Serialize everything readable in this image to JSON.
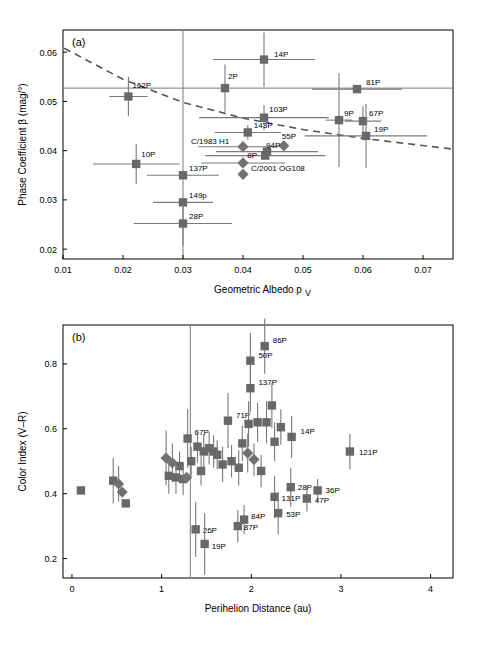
{
  "figure": {
    "width": 482,
    "height": 651,
    "marker_color": "#686868",
    "diamond_color": "#717171",
    "trend_color": "#555555",
    "error_color": "#7a7a7a"
  },
  "chart_data": [
    {
      "type": "scatter",
      "panel": "(a)",
      "title": "",
      "xlabel": "Geometric Albedo p_V",
      "ylabel": "Phase Coefficient β (mag/°)",
      "xlim": [
        0.01,
        0.075
      ],
      "ylim": [
        0.018,
        0.0645
      ],
      "xticks": [
        0.01,
        0.02,
        0.03,
        0.04,
        0.05,
        0.06,
        0.07
      ],
      "xticklabels": [
        "0.01",
        "0.02",
        "0.03",
        "0.04",
        "0.05",
        "0.06",
        "0.07"
      ],
      "yticks": [
        0.02,
        0.03,
        0.04,
        0.05,
        0.06
      ],
      "yticklabels": [
        "0.02",
        "0.03",
        "0.04",
        "0.05",
        "0.06"
      ],
      "grid": false,
      "legend": "none",
      "reference_lines": [
        {
          "orientation": "horizontal",
          "value": 0.0527
        },
        {
          "orientation": "vertical",
          "value": 0.03
        }
      ],
      "trend": {
        "style": "dashed",
        "points": [
          {
            "x": 0.0102,
            "y": 0.0608
          },
          {
            "x": 0.02,
            "y": 0.0545
          },
          {
            "x": 0.03,
            "y": 0.0498
          },
          {
            "x": 0.04,
            "y": 0.0466
          },
          {
            "x": 0.05,
            "y": 0.0443
          },
          {
            "x": 0.06,
            "y": 0.0425
          },
          {
            "x": 0.075,
            "y": 0.0403
          }
        ]
      },
      "points": [
        {
          "label": "14P",
          "marker": "square",
          "x": 0.0435,
          "y": 0.0585,
          "xerr": 0.0085,
          "yerr": 0.0055,
          "lx": 10,
          "ly": -3
        },
        {
          "label": "2P",
          "marker": "square",
          "x": 0.037,
          "y": 0.0527,
          "xerr": 0.0,
          "yerr": 0.0048,
          "lx": 3,
          "ly": -9
        },
        {
          "label": "81P",
          "marker": "square",
          "x": 0.059,
          "y": 0.0525,
          "xerr": 0.0075,
          "yerr": 0.0,
          "lx": 9,
          "ly": -4
        },
        {
          "label": "162P",
          "marker": "square",
          "x": 0.0209,
          "y": 0.051,
          "xerr": 0.0032,
          "yerr": 0.004,
          "lx": 4,
          "ly": -8
        },
        {
          "label": "103P",
          "marker": "square",
          "x": 0.0435,
          "y": 0.0467,
          "xerr": 0.0108,
          "yerr": 0.0025,
          "lx": 5,
          "ly": -6
        },
        {
          "label": "9P",
          "marker": "square",
          "x": 0.056,
          "y": 0.0462,
          "xerr": 0.0022,
          "yerr": 0.0095,
          "lx": 5,
          "ly": -4
        },
        {
          "label": "67P",
          "marker": "square",
          "x": 0.06,
          "y": 0.046,
          "xerr": 0.003,
          "yerr": 0.003,
          "lx": 6,
          "ly": -5
        },
        {
          "label": "143P",
          "marker": "square",
          "x": 0.0408,
          "y": 0.0437,
          "xerr": 0.0055,
          "yerr": 0.0015,
          "lx": 6,
          "ly": -4
        },
        {
          "label": "19P",
          "marker": "square",
          "x": 0.0605,
          "y": 0.043,
          "xerr": 0.0102,
          "yerr": 0.0065,
          "lx": 8,
          "ly": -4
        },
        {
          "label": "55P",
          "marker": "diamond",
          "x": 0.0468,
          "y": 0.041,
          "xerr": 0.0,
          "yerr": 0.0,
          "lx": -2,
          "ly": -7
        },
        {
          "label": "C/1983 H1",
          "marker": "diamond",
          "x": 0.04,
          "y": 0.0408,
          "xerr": 0.0075,
          "yerr": 0.0,
          "lx": -52,
          "ly": -3
        },
        {
          "label": "94P",
          "marker": "square",
          "x": 0.044,
          "y": 0.0398,
          "xerr": 0.0085,
          "yerr": 0.0,
          "lx": -1,
          "ly": -4
        },
        {
          "label": "8P",
          "marker": "square",
          "x": 0.0437,
          "y": 0.039,
          "xerr": 0.01,
          "yerr": 0.0,
          "lx": -18,
          "ly": 2
        },
        {
          "label": "10P",
          "marker": "square",
          "x": 0.0222,
          "y": 0.0373,
          "xerr": 0.0072,
          "yerr": 0.004,
          "lx": 5,
          "ly": -7
        },
        {
          "label": "C/2001 OG108",
          "marker": "diamond",
          "x": 0.04,
          "y": 0.0375,
          "xerr": 0.007,
          "yerr": 0.0,
          "lx": 8,
          "ly": 8
        },
        {
          "label": "137P",
          "marker": "square",
          "x": 0.03,
          "y": 0.035,
          "xerr": 0.006,
          "yerr": 0.0,
          "lx": 6,
          "ly": -4
        },
        {
          "label": "",
          "marker": "diamond",
          "x": 0.04,
          "y": 0.0352,
          "xerr": 0.0,
          "yerr": 0.0,
          "lx": 0,
          "ly": 0
        },
        {
          "label": "149p",
          "marker": "square",
          "x": 0.03,
          "y": 0.0295,
          "xerr": 0.005,
          "yerr": 0.0,
          "lx": 6,
          "ly": -4
        },
        {
          "label": "28P",
          "marker": "square",
          "x": 0.03,
          "y": 0.0252,
          "xerr": 0.0082,
          "yerr": 0.0045,
          "lx": 6,
          "ly": -5
        }
      ]
    },
    {
      "type": "scatter",
      "panel": "(b)",
      "title": "",
      "xlabel": "Perihelion Distance (au)",
      "ylabel": "Color Index (V–R)",
      "xlim": [
        -0.1,
        4.25
      ],
      "ylim": [
        0.14,
        0.92
      ],
      "xticks": [
        0,
        1,
        2,
        3,
        4
      ],
      "xticklabels": [
        "0",
        "1",
        "2",
        "3",
        "4"
      ],
      "yticks": [
        0.2,
        0.4,
        0.6,
        0.8
      ],
      "yticklabels": [
        "0.2",
        "0.4",
        "0.6",
        "0.8"
      ],
      "grid": false,
      "legend": "none",
      "reference_lines": [
        {
          "orientation": "vertical",
          "value": 1.32
        }
      ],
      "points": [
        {
          "label": "86P",
          "marker": "square",
          "x": 2.15,
          "y": 0.855,
          "yerr": 0.085,
          "lx": 8,
          "ly": -3
        },
        {
          "label": "50P",
          "marker": "square",
          "x": 1.99,
          "y": 0.81,
          "yerr": 0.085,
          "lx": 8,
          "ly": -3
        },
        {
          "label": "137P",
          "marker": "square",
          "x": 1.99,
          "y": 0.725,
          "yerr": 0.075,
          "lx": 8,
          "ly": -3
        },
        {
          "label": "71P",
          "marker": "square",
          "x": 1.74,
          "y": 0.625,
          "yerr": 0.085,
          "lx": 8,
          "ly": -3
        },
        {
          "label": "",
          "marker": "square",
          "x": 2.23,
          "y": 0.672,
          "yerr": 0.07,
          "lx": 0,
          "ly": 0
        },
        {
          "label": "",
          "marker": "square",
          "x": 2.07,
          "y": 0.62,
          "yerr": 0.06,
          "lx": 0,
          "ly": 0
        },
        {
          "label": "",
          "marker": "square",
          "x": 2.17,
          "y": 0.62,
          "yerr": 0.065,
          "lx": 0,
          "ly": 0
        },
        {
          "label": "",
          "marker": "square",
          "x": 1.97,
          "y": 0.615,
          "yerr": 0.07,
          "lx": 0,
          "ly": 0
        },
        {
          "label": "",
          "marker": "square",
          "x": 2.33,
          "y": 0.605,
          "yerr": 0.055,
          "lx": 0,
          "ly": 0
        },
        {
          "label": "67P",
          "marker": "square",
          "x": 1.29,
          "y": 0.57,
          "yerr": 0.09,
          "lx": 7,
          "ly": -4
        },
        {
          "label": "14P",
          "marker": "square",
          "x": 2.45,
          "y": 0.575,
          "yerr": 0.065,
          "lx": 9,
          "ly": -3
        },
        {
          "label": "",
          "marker": "square",
          "x": 2.26,
          "y": 0.56,
          "yerr": 0.06,
          "lx": 0,
          "ly": 0
        },
        {
          "label": "",
          "marker": "square",
          "x": 1.9,
          "y": 0.555,
          "yerr": 0.055,
          "lx": 0,
          "ly": 0
        },
        {
          "label": "",
          "marker": "square",
          "x": 1.4,
          "y": 0.545,
          "yerr": 0.05,
          "lx": 0,
          "ly": 0
        },
        {
          "label": "",
          "marker": "square",
          "x": 1.47,
          "y": 0.53,
          "yerr": 0.055,
          "lx": 0,
          "ly": 0
        },
        {
          "label": "",
          "marker": "square",
          "x": 1.53,
          "y": 0.54,
          "yerr": 0.05,
          "lx": 0,
          "ly": 0
        },
        {
          "label": "",
          "marker": "square",
          "x": 1.58,
          "y": 0.53,
          "yerr": 0.05,
          "lx": 0,
          "ly": 0
        },
        {
          "label": "",
          "marker": "square",
          "x": 1.62,
          "y": 0.52,
          "yerr": 0.045,
          "lx": 0,
          "ly": 0
        },
        {
          "label": "",
          "marker": "diamond",
          "x": 1.05,
          "y": 0.51,
          "yerr": 0.085,
          "lx": 0,
          "ly": 0
        },
        {
          "label": "",
          "marker": "diamond",
          "x": 1.12,
          "y": 0.495,
          "yerr": 0.06,
          "lx": 0,
          "ly": 0
        },
        {
          "label": "",
          "marker": "diamond",
          "x": 1.96,
          "y": 0.525,
          "yerr": 0.06,
          "lx": 0,
          "ly": 0
        },
        {
          "label": "",
          "marker": "diamond",
          "x": 2.03,
          "y": 0.505,
          "yerr": 0.05,
          "lx": 0,
          "ly": 0
        },
        {
          "label": "121P",
          "marker": "square",
          "x": 3.1,
          "y": 0.53,
          "yerr": 0.055,
          "lx": 9,
          "ly": 3
        },
        {
          "label": "",
          "marker": "square",
          "x": 1.2,
          "y": 0.485,
          "yerr": 0.045,
          "lx": 0,
          "ly": 0
        },
        {
          "label": "",
          "marker": "square",
          "x": 1.33,
          "y": 0.5,
          "yerr": 0.045,
          "lx": 0,
          "ly": 0
        },
        {
          "label": "",
          "marker": "square",
          "x": 1.44,
          "y": 0.47,
          "yerr": 0.045,
          "lx": 0,
          "ly": 0
        },
        {
          "label": "",
          "marker": "square",
          "x": 1.68,
          "y": 0.49,
          "yerr": 0.055,
          "lx": 0,
          "ly": 0
        },
        {
          "label": "",
          "marker": "square",
          "x": 1.78,
          "y": 0.5,
          "yerr": 0.05,
          "lx": 0,
          "ly": 0
        },
        {
          "label": "",
          "marker": "square",
          "x": 1.86,
          "y": 0.48,
          "yerr": 0.055,
          "lx": 0,
          "ly": 0
        },
        {
          "label": "",
          "marker": "square",
          "x": 2.11,
          "y": 0.47,
          "yerr": 0.05,
          "lx": 0,
          "ly": 0
        },
        {
          "label": "",
          "marker": "square",
          "x": 1.08,
          "y": 0.455,
          "yerr": 0.055,
          "lx": 0,
          "ly": 0
        },
        {
          "label": "",
          "marker": "square",
          "x": 1.16,
          "y": 0.45,
          "yerr": 0.05,
          "lx": 0,
          "ly": 0
        },
        {
          "label": "",
          "marker": "square",
          "x": 1.24,
          "y": 0.445,
          "yerr": 0.05,
          "lx": 0,
          "ly": 0
        },
        {
          "label": "",
          "marker": "diamond",
          "x": 1.28,
          "y": 0.45,
          "yerr": 0.0,
          "lx": 0,
          "ly": 0
        },
        {
          "label": "",
          "marker": "square",
          "x": 0.1,
          "y": 0.41,
          "yerr": 0.0,
          "lx": 0,
          "ly": 0
        },
        {
          "label": "",
          "marker": "square",
          "x": 0.46,
          "y": 0.44,
          "yerr": 0.07,
          "lx": 0,
          "ly": 0
        },
        {
          "label": "",
          "marker": "diamond",
          "x": 0.52,
          "y": 0.43,
          "yerr": 0.055,
          "lx": 0,
          "ly": 0
        },
        {
          "label": "",
          "marker": "diamond",
          "x": 0.56,
          "y": 0.405,
          "yerr": 0.0,
          "lx": 0,
          "ly": 0
        },
        {
          "label": "",
          "marker": "square",
          "x": 0.6,
          "y": 0.37,
          "yerr": 0.0,
          "lx": 0,
          "ly": 0
        },
        {
          "label": "28P",
          "marker": "square",
          "x": 2.44,
          "y": 0.42,
          "yerr": 0.06,
          "lx": 7,
          "ly": 3
        },
        {
          "label": "36P",
          "marker": "square",
          "x": 2.74,
          "y": 0.41,
          "yerr": 0.035,
          "lx": 8,
          "ly": 3
        },
        {
          "label": "131P",
          "marker": "square",
          "x": 2.26,
          "y": 0.39,
          "yerr": 0.065,
          "lx": 7,
          "ly": 4
        },
        {
          "label": "47P",
          "marker": "square",
          "x": 2.62,
          "y": 0.385,
          "yerr": 0.04,
          "lx": 8,
          "ly": 4
        },
        {
          "label": "53P",
          "marker": "square",
          "x": 2.3,
          "y": 0.34,
          "yerr": 0.065,
          "lx": 8,
          "ly": 4
        },
        {
          "label": "84P",
          "marker": "square",
          "x": 1.92,
          "y": 0.32,
          "yerr": 0.045,
          "lx": 7,
          "ly": -1
        },
        {
          "label": "87P",
          "marker": "square",
          "x": 1.85,
          "y": 0.3,
          "yerr": 0.05,
          "lx": 6,
          "ly": 4
        },
        {
          "label": "26P",
          "marker": "square",
          "x": 1.38,
          "y": 0.29,
          "yerr": 0.085,
          "lx": 7,
          "ly": 4
        },
        {
          "label": "19P",
          "marker": "square",
          "x": 1.48,
          "y": 0.245,
          "yerr": 0.095,
          "lx": 7,
          "ly": 5
        }
      ]
    }
  ]
}
